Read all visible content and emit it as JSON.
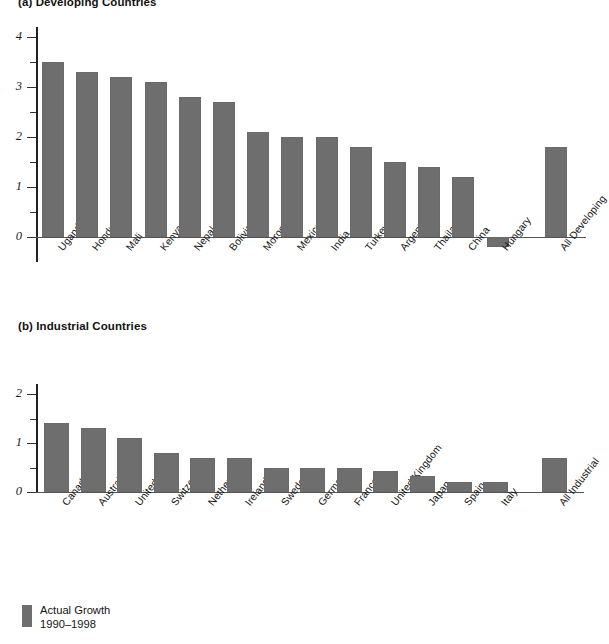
{
  "legend": {
    "label_line1": "Actual Growth",
    "label_line2": "1990–1998",
    "swatch_color": "#6e6e6e"
  },
  "panels": [
    {
      "id": "a",
      "title": "(a) Developing Countries"
    },
    {
      "id": "b",
      "title": "(b) Industrial Countries"
    }
  ],
  "chart_data": [
    {
      "type": "bar",
      "title": "(a) Developing Countries",
      "xlabel": "",
      "ylabel": "",
      "ylim": [
        -0.5,
        4.2
      ],
      "yticks": [
        0,
        1,
        2,
        3,
        4
      ],
      "ytick_labels": [
        "0",
        "1",
        "2",
        "3",
        "4"
      ],
      "yminor_ticks": [
        0.5,
        1.5,
        2.5,
        3.5
      ],
      "grid": false,
      "legend_position": "below-figure",
      "bar_color": "#6e6e6e",
      "series_name": "Actual Growth 1990–1998",
      "categories": [
        "Uganda",
        "Honduras",
        "Mali",
        "Kenya",
        "Nepal",
        "Bolivia",
        "Morocco",
        "Mexico",
        "India",
        "Turkey",
        "Argentina",
        "Thailand",
        "China",
        "Hungary",
        "All Developing"
      ],
      "values": [
        3.5,
        3.3,
        3.2,
        3.1,
        2.8,
        2.7,
        2.1,
        2.0,
        2.0,
        1.8,
        1.5,
        1.4,
        1.2,
        -0.2,
        1.8
      ]
    },
    {
      "type": "bar",
      "title": "(b) Industrial Countries",
      "xlabel": "",
      "ylabel": "",
      "ylim": [
        0,
        2.2
      ],
      "yticks": [
        0,
        1,
        2
      ],
      "ytick_labels": [
        "0",
        "1",
        "2"
      ],
      "yminor_ticks": [
        0.5,
        1.5
      ],
      "grid": false,
      "legend_position": "below-figure",
      "bar_color": "#6e6e6e",
      "series_name": "Actual Growth 1990–1998",
      "categories": [
        "Canada",
        "Australia",
        "United States",
        "Switzerland",
        "Netherlands",
        "Ireland",
        "Sweden",
        "Germany",
        "France",
        "United Kingdom",
        "Japan",
        "Spain",
        "Italy",
        "All Industrial"
      ],
      "values": [
        1.4,
        1.3,
        1.1,
        0.8,
        0.7,
        0.7,
        0.5,
        0.5,
        0.5,
        0.42,
        0.32,
        0.2,
        0.2,
        0.7
      ]
    }
  ]
}
